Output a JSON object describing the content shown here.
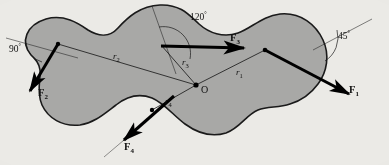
{
  "figure": {
    "type": "free-body-diagram",
    "background_color": "#ebeae6",
    "body_fill_color": "#a8a8a6",
    "body_outline_color": "#1a1a1a",
    "vector_color": "#000000"
  },
  "origin": {
    "label": "O",
    "x": 196,
    "y": 85
  },
  "forces": [
    {
      "id": "F1",
      "label": "F",
      "subscript": "1",
      "application_point": [
        265,
        50
      ],
      "tip": [
        352,
        96
      ],
      "angle_label": "45",
      "angle_unit": "°"
    },
    {
      "id": "F2",
      "label": "F",
      "subscript": "2",
      "application_point": [
        58,
        44
      ],
      "tip": [
        28,
        94
      ],
      "angle_label": "90",
      "angle_unit": "°"
    },
    {
      "id": "F3",
      "label": "F",
      "subscript": "3",
      "application_point": [
        161,
        45
      ],
      "tip": [
        247,
        48
      ],
      "angle_label": "120",
      "angle_unit": "°"
    },
    {
      "id": "F4",
      "label": "F",
      "subscript": "4",
      "application_point": [
        152,
        110
      ],
      "tip": [
        121,
        143
      ],
      "angle_label": null,
      "angle_unit": null
    }
  ],
  "position_vectors": [
    {
      "id": "r1",
      "label": "r",
      "subscript": "1",
      "from": [
        196,
        85
      ],
      "to": [
        265,
        50
      ],
      "label_pos": [
        238,
        72
      ]
    },
    {
      "id": "r2",
      "label": "r",
      "subscript": "2",
      "from": [
        196,
        85
      ],
      "to": [
        58,
        44
      ],
      "label_pos": [
        118,
        57
      ]
    },
    {
      "id": "r3",
      "label": "r",
      "subscript": "3",
      "from": [
        196,
        85
      ],
      "to": [
        161,
        45
      ],
      "label_pos": [
        184,
        63
      ]
    },
    {
      "id": "r4",
      "label": "r",
      "subscript": "4",
      "from": [
        196,
        85
      ],
      "to": [
        152,
        110
      ],
      "label_pos": [
        168,
        101
      ]
    }
  ],
  "angles": [
    {
      "id": "angle-90",
      "value": "90",
      "unit": "°",
      "label_pos": [
        13,
        47
      ]
    },
    {
      "id": "angle-120",
      "value": "120",
      "unit": "°",
      "label_pos": [
        198,
        15
      ]
    },
    {
      "id": "angle-45",
      "value": "45",
      "unit": "°",
      "label_pos": [
        340,
        34
      ]
    }
  ]
}
